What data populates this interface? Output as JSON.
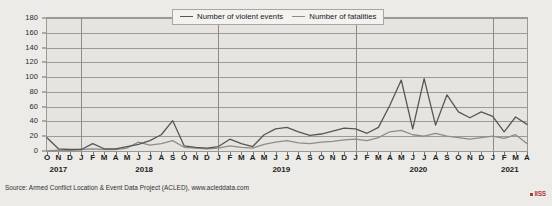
{
  "chart_data": {
    "type": "line",
    "title": "",
    "xlabel": "",
    "ylabel": "",
    "ylim": [
      0,
      180
    ],
    "ytick_step": 20,
    "yticks": [
      0,
      20,
      40,
      60,
      80,
      100,
      120,
      140,
      160,
      180
    ],
    "grid": true,
    "legend_position": "top-center",
    "source": "Source: Armed Conflict Location & Event Data Project (ACLED), www.acleddata.com",
    "brand": "IISS",
    "brand_color": "#b03a3a",
    "x": [
      "O",
      "N",
      "D",
      "J",
      "F",
      "M",
      "A",
      "M",
      "J",
      "J",
      "A",
      "S",
      "O",
      "N",
      "D",
      "J",
      "F",
      "M",
      "A",
      "M",
      "J",
      "J",
      "A",
      "S",
      "O",
      "N",
      "D",
      "J",
      "F",
      "M",
      "A",
      "M",
      "J",
      "J",
      "A",
      "S",
      "O",
      "N",
      "D",
      "J",
      "F",
      "M",
      "A"
    ],
    "year_groups": [
      {
        "label": "2017",
        "start_index": 0,
        "end_index": 2
      },
      {
        "label": "2018",
        "start_index": 3,
        "end_index": 14
      },
      {
        "label": "2019",
        "start_index": 15,
        "end_index": 26
      },
      {
        "label": "2020",
        "start_index": 27,
        "end_index": 38
      },
      {
        "label": "2021",
        "start_index": 39,
        "end_index": 42
      }
    ],
    "year_dividers": [
      3,
      15,
      27,
      39
    ],
    "series": [
      {
        "name": "Number of violent events",
        "color": "#4a4a4a",
        "values": [
          18,
          3,
          2,
          3,
          10,
          3,
          3,
          6,
          9,
          14,
          22,
          41,
          7,
          5,
          4,
          6,
          16,
          10,
          6,
          22,
          30,
          32,
          26,
          21,
          23,
          27,
          31,
          30,
          24,
          32,
          62,
          96,
          30,
          98,
          35,
          76,
          53,
          45,
          53,
          47,
          26,
          46,
          36
        ]
      },
      {
        "name": "Number of fatalities",
        "color": "#8e8c88",
        "values": [
          18,
          3,
          2,
          3,
          10,
          3,
          3,
          6,
          9,
          14,
          22,
          41,
          7,
          5,
          4,
          6,
          16,
          10,
          6,
          22,
          30,
          32,
          26,
          21,
          23,
          27,
          31,
          30,
          24,
          32,
          62,
          96,
          30,
          98,
          35,
          76,
          53,
          45,
          53,
          47,
          26,
          46,
          36
        ]
      }
    ],
    "series_violent_events": {
      "name": "Number of violent events",
      "color": "#585654",
      "values": [
        18,
        3,
        2,
        2,
        10,
        3,
        3,
        6,
        9,
        14,
        22,
        41,
        7,
        5,
        4,
        6,
        16,
        10,
        6,
        22,
        30,
        32,
        26,
        21,
        23,
        27,
        31,
        30,
        24,
        32,
        62,
        96,
        30,
        98,
        35,
        76,
        53,
        45,
        53,
        47,
        26,
        46,
        36
      ]
    },
    "series_fatalities": {
      "name": "Number of fatalities",
      "color": "#8e8c88",
      "values": [
        0,
        1,
        1,
        2,
        3,
        2,
        2,
        4,
        12,
        8,
        10,
        14,
        5,
        4,
        3,
        4,
        7,
        5,
        4,
        9,
        12,
        14,
        11,
        10,
        12,
        13,
        15,
        16,
        14,
        18,
        26,
        28,
        22,
        20,
        24,
        20,
        18,
        16,
        18,
        20,
        17,
        22,
        10
      ]
    },
    "events_values": [
      18,
      3,
      2,
      2,
      10,
      3,
      3,
      6,
      9,
      14,
      22,
      41,
      7,
      5,
      4,
      6,
      16,
      10,
      6,
      22,
      30,
      32,
      26,
      21,
      23,
      27,
      31,
      30,
      24,
      32,
      62,
      96,
      30,
      98,
      35,
      76,
      53,
      45,
      53,
      47,
      26,
      46,
      36
    ],
    "fatalities_values": [
      0,
      1,
      1,
      2,
      3,
      2,
      2,
      4,
      12,
      8,
      10,
      14,
      5,
      4,
      3,
      4,
      7,
      5,
      4,
      9,
      12,
      14,
      11,
      10,
      12,
      13,
      15,
      16,
      14,
      18,
      26,
      28,
      22,
      20,
      24,
      20,
      18,
      16,
      18,
      20,
      17,
      22,
      10
    ]
  },
  "legend": {
    "items": [
      {
        "label": "Number of violent events",
        "color": "#585654"
      },
      {
        "label": "Number of fatalities",
        "color": "#8e8c88"
      }
    ]
  },
  "footer": {
    "source": "Source: Armed Conflict Location & Event Data Project (ACLED), www.acleddata.com",
    "brand": "IISS"
  }
}
